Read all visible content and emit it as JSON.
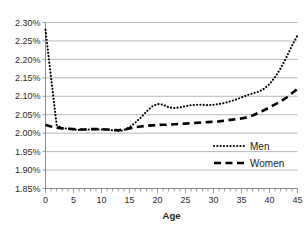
{
  "chart_data": {
    "type": "line",
    "title": "",
    "xlabel": "Age",
    "ylabel": "",
    "xlim": [
      0,
      45
    ],
    "ylim": [
      1.85,
      2.3
    ],
    "grid": true,
    "legend_position": "lower-right-inside",
    "y_ticks": [
      "1.85%",
      "1.90%",
      "1.95%",
      "2.00%",
      "2.05%",
      "2.10%",
      "2.15%",
      "2.20%",
      "2.25%",
      "2.30%"
    ],
    "y_tick_values": [
      1.85,
      1.9,
      1.95,
      2.0,
      2.05,
      2.1,
      2.15,
      2.2,
      2.25,
      2.3
    ],
    "x_ticks": [
      "0",
      "5",
      "10",
      "15",
      "20",
      "25",
      "30",
      "35",
      "40",
      "45"
    ],
    "x_tick_values": [
      0,
      5,
      10,
      15,
      20,
      25,
      30,
      35,
      40,
      45
    ],
    "x_minor_tick_step": 1,
    "x": [
      0,
      1,
      2,
      3,
      4,
      5,
      6,
      7,
      8,
      9,
      10,
      11,
      12,
      13,
      14,
      15,
      16,
      17,
      18,
      19,
      20,
      21,
      22,
      23,
      24,
      25,
      26,
      27,
      28,
      29,
      30,
      31,
      32,
      33,
      34,
      35,
      36,
      37,
      38,
      39,
      40,
      41,
      42,
      43,
      44,
      45
    ],
    "series": [
      {
        "name": "Men",
        "style": "dotted",
        "color": "#000000",
        "values": [
          2.28,
          2.15,
          2.022,
          2.014,
          2.012,
          2.01,
          2.009,
          2.01,
          2.01,
          2.01,
          2.01,
          2.009,
          2.008,
          2.006,
          2.008,
          2.016,
          2.028,
          2.042,
          2.058,
          2.072,
          2.079,
          2.077,
          2.07,
          2.068,
          2.07,
          2.073,
          2.076,
          2.077,
          2.077,
          2.076,
          2.077,
          2.079,
          2.082,
          2.086,
          2.091,
          2.097,
          2.103,
          2.108,
          2.112,
          2.12,
          2.133,
          2.152,
          2.176,
          2.205,
          2.237,
          2.265
        ]
      },
      {
        "name": "Women",
        "style": "dashed",
        "color": "#000000",
        "values": [
          2.022,
          2.018,
          2.015,
          2.013,
          2.012,
          2.011,
          2.01,
          2.01,
          2.011,
          2.011,
          2.011,
          2.01,
          2.009,
          2.008,
          2.01,
          2.013,
          2.016,
          2.018,
          2.02,
          2.021,
          2.022,
          2.023,
          2.023,
          2.024,
          2.025,
          2.026,
          2.027,
          2.028,
          2.029,
          2.03,
          2.031,
          2.032,
          2.034,
          2.036,
          2.038,
          2.04,
          2.043,
          2.048,
          2.055,
          2.062,
          2.07,
          2.078,
          2.086,
          2.096,
          2.108,
          2.12
        ]
      }
    ]
  },
  "legend": {
    "items": [
      {
        "label": "Men"
      },
      {
        "label": "Women"
      }
    ]
  }
}
